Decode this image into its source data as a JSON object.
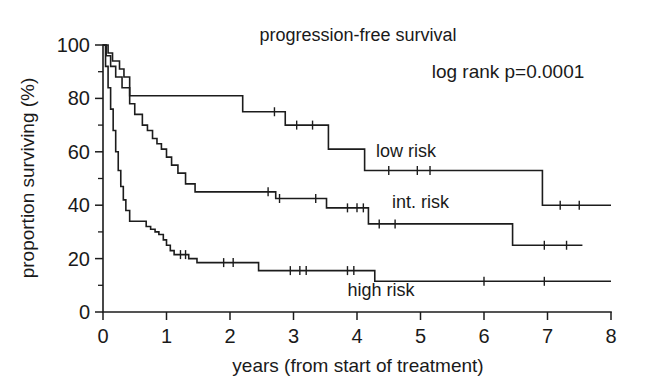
{
  "figure": {
    "title": "progression-free survival",
    "annotation": "log rank p=0.0001",
    "x_axis_title": "years (from start of treatment)",
    "y_axis_title": "proportion surviving (%)",
    "line_color": "#1c1c1c",
    "background_color": "#ffffff"
  },
  "chart_data": {
    "type": "line",
    "plot_kind": "kaplan-meier-survival",
    "title": "progression-free survival",
    "xlabel": "years (from start of treatment)",
    "ylabel": "proportion surviving (%)",
    "xlim": [
      0,
      8
    ],
    "ylim": [
      0,
      100
    ],
    "xticks": [
      0,
      1,
      2,
      3,
      4,
      5,
      6,
      7,
      8
    ],
    "xtick_labels": [
      "0",
      "1",
      "2",
      "3",
      "4",
      "5",
      "6",
      "7",
      "8"
    ],
    "yticks": [
      0,
      20,
      40,
      60,
      80,
      100
    ],
    "ytick_labels": [
      "0",
      "20",
      "40",
      "60",
      "80",
      "100"
    ],
    "y_minor_ticks": [
      10,
      30,
      50,
      70,
      90
    ],
    "grid": false,
    "legend": "inline-labels",
    "annotations": [
      {
        "text": "log rank p=0.0001",
        "x": 5.25,
        "y": 92
      },
      {
        "text": "low risk",
        "x": 4.3,
        "y": 58
      },
      {
        "text": "int. risk",
        "x": 4.55,
        "y": 39
      },
      {
        "text": "high risk",
        "x": 3.85,
        "y": 6
      }
    ],
    "series": [
      {
        "name": "low risk",
        "label": "low risk",
        "label_x": 4.3,
        "label_y": 58,
        "steps": [
          [
            0.0,
            100
          ],
          [
            0.08,
            97
          ],
          [
            0.15,
            94
          ],
          [
            0.26,
            91
          ],
          [
            0.33,
            88
          ],
          [
            0.42,
            81
          ],
          [
            2.18,
            81
          ],
          [
            2.2,
            75
          ],
          [
            2.85,
            75
          ],
          [
            2.87,
            70
          ],
          [
            3.52,
            70
          ],
          [
            3.55,
            61
          ],
          [
            4.08,
            61
          ],
          [
            4.12,
            53
          ],
          [
            6.88,
            53
          ],
          [
            6.92,
            40
          ],
          [
            8.0,
            40
          ]
        ],
        "censored": [
          2.7,
          3.05,
          3.3,
          4.5,
          4.95,
          5.15,
          7.2,
          7.5
        ]
      },
      {
        "name": "int. risk",
        "label": "int. risk",
        "label_x": 4.55,
        "label_y": 39,
        "steps": [
          [
            0.0,
            100
          ],
          [
            0.05,
            96
          ],
          [
            0.12,
            92
          ],
          [
            0.2,
            88
          ],
          [
            0.3,
            84
          ],
          [
            0.42,
            78
          ],
          [
            0.5,
            74
          ],
          [
            0.62,
            70
          ],
          [
            0.7,
            68
          ],
          [
            0.78,
            65
          ],
          [
            0.85,
            63
          ],
          [
            0.92,
            61
          ],
          [
            1.0,
            58
          ],
          [
            1.08,
            55
          ],
          [
            1.18,
            52
          ],
          [
            1.3,
            48
          ],
          [
            1.45,
            45
          ],
          [
            2.68,
            45
          ],
          [
            2.72,
            42.5
          ],
          [
            3.48,
            42.5
          ],
          [
            3.52,
            39
          ],
          [
            4.12,
            39
          ],
          [
            4.18,
            33
          ],
          [
            6.4,
            33
          ],
          [
            6.45,
            25
          ],
          [
            7.55,
            25
          ]
        ],
        "censored": [
          2.6,
          2.78,
          3.35,
          3.85,
          4.0,
          4.1,
          4.35,
          4.6,
          6.95,
          7.3
        ]
      },
      {
        "name": "high risk",
        "label": "high risk",
        "label_x": 3.85,
        "label_y": 6,
        "steps": [
          [
            0.0,
            100
          ],
          [
            0.04,
            92
          ],
          [
            0.08,
            84
          ],
          [
            0.12,
            76
          ],
          [
            0.16,
            68
          ],
          [
            0.2,
            60
          ],
          [
            0.24,
            53
          ],
          [
            0.28,
            47
          ],
          [
            0.32,
            42
          ],
          [
            0.36,
            38
          ],
          [
            0.42,
            34
          ],
          [
            0.62,
            34
          ],
          [
            0.68,
            32
          ],
          [
            0.75,
            31
          ],
          [
            0.82,
            30
          ],
          [
            0.88,
            29
          ],
          [
            0.95,
            27
          ],
          [
            1.0,
            25
          ],
          [
            1.06,
            23
          ],
          [
            1.12,
            21.5
          ],
          [
            1.28,
            21.5
          ],
          [
            1.35,
            20
          ],
          [
            1.48,
            18.5
          ],
          [
            2.4,
            18.5
          ],
          [
            2.45,
            15.5
          ],
          [
            4.22,
            15.5
          ],
          [
            4.28,
            11.5
          ],
          [
            8.0,
            11.5
          ]
        ],
        "censored": [
          1.22,
          1.3,
          1.9,
          2.05,
          2.95,
          3.1,
          3.2,
          3.85,
          3.95,
          6.0,
          6.95
        ]
      }
    ]
  }
}
